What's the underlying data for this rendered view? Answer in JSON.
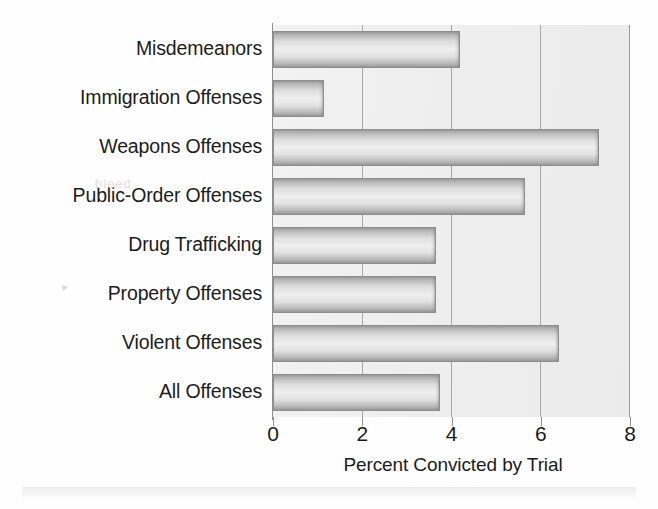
{
  "chart_data": {
    "type": "bar",
    "orientation": "horizontal",
    "title": "",
    "xlabel": "Percent Convicted by Trial",
    "ylabel": "",
    "xlim": [
      0,
      8
    ],
    "xticks": [
      "0",
      "2",
      "4",
      "6",
      "8"
    ],
    "grid": "vertical",
    "legend": "none",
    "categories": [
      "Misdemeanors",
      "Immigration Offenses",
      "Weapons Offenses",
      "Public-Order Offenses",
      "Drug Trafficking",
      "Property Offenses",
      "Violent Offenses",
      "All Offenses"
    ],
    "values": [
      4.2,
      1.15,
      7.3,
      5.65,
      3.65,
      3.65,
      6.4,
      3.75
    ]
  },
  "axis": {
    "x_title": "Percent Convicted by Trial",
    "ticks": [
      {
        "label": "0",
        "value": 0
      },
      {
        "label": "2",
        "value": 2
      },
      {
        "label": "4",
        "value": 4
      },
      {
        "label": "6",
        "value": 6
      },
      {
        "label": "8",
        "value": 8
      }
    ]
  },
  "bars": [
    {
      "label": "Misdemeanors",
      "value": 4.2
    },
    {
      "label": "Immigration Offenses",
      "value": 1.15
    },
    {
      "label": "Weapons Offenses",
      "value": 7.3
    },
    {
      "label": "Public-Order Offenses",
      "value": 5.65
    },
    {
      "label": "Drug Trafficking",
      "value": 3.65
    },
    {
      "label": "Property Offenses",
      "value": 3.65
    },
    {
      "label": "Violent Offenses",
      "value": 6.4
    },
    {
      "label": "All Offenses",
      "value": 3.75
    }
  ],
  "artifacts": {
    "ghost_text": "bleed"
  },
  "colors": {
    "bar_fill": "#e2e2e2",
    "bar_edge": "#8d8d8d",
    "plot_background": "#efefef",
    "gridline": "#a9a9a9",
    "text": "#1c1c1c"
  }
}
